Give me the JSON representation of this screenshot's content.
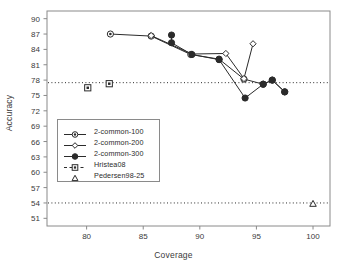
{
  "chart_data": {
    "type": "line",
    "title": "",
    "xlabel": "Coverage",
    "ylabel": "Accuracy",
    "xlim": [
      76.5,
      101.5
    ],
    "ylim": [
      49.5,
      91.5
    ],
    "xticks": [
      80,
      85,
      90,
      95,
      100
    ],
    "yticks": [
      51,
      54,
      57,
      60,
      63,
      66,
      69,
      72,
      75,
      78,
      81,
      84,
      87,
      90
    ],
    "grid": false,
    "legend_position": "center-left",
    "reference_lines": [
      {
        "name": "hristea08-reference",
        "y": 77.5,
        "style": "dotted"
      },
      {
        "name": "pedersen98-reference",
        "y": 54.0,
        "style": "dotted"
      }
    ],
    "series": [
      {
        "name": "2-common-100",
        "marker": "circle-dot",
        "points": [
          {
            "x": 82.1,
            "y": 87.0
          },
          {
            "x": 85.7,
            "y": 86.6
          },
          {
            "x": 89.2,
            "y": 83.0
          },
          {
            "x": 91.7,
            "y": 82.1
          },
          {
            "x": 93.9,
            "y": 78.2
          },
          {
            "x": 95.6,
            "y": 77.2
          },
          {
            "x": 96.4,
            "y": 78.0
          },
          {
            "x": 97.5,
            "y": 75.7
          }
        ]
      },
      {
        "name": "2-common-200",
        "marker": "open-diamond",
        "points": [
          {
            "x": 85.7,
            "y": 86.7
          },
          {
            "x": 89.3,
            "y": 83.1
          },
          {
            "x": 92.3,
            "y": 83.2
          },
          {
            "x": 93.9,
            "y": 78.3
          },
          {
            "x": 94.7,
            "y": 85.1
          }
        ]
      },
      {
        "name": "2-common-300",
        "marker": "filled-circle",
        "points": [
          {
            "x": 87.5,
            "y": 86.8
          },
          {
            "x": 87.5,
            "y": 85.3
          },
          {
            "x": 89.3,
            "y": 83.0
          },
          {
            "x": 91.7,
            "y": 82.0
          },
          {
            "x": 94.0,
            "y": 74.5
          },
          {
            "x": 95.6,
            "y": 77.2
          },
          {
            "x": 96.4,
            "y": 78.0
          },
          {
            "x": 97.5,
            "y": 75.7
          }
        ]
      },
      {
        "name": "Hristea08",
        "marker": "square",
        "points": [
          {
            "x": 80.1,
            "y": 76.5
          },
          {
            "x": 82.0,
            "y": 77.3
          }
        ]
      },
      {
        "name": "Pedersen98-25",
        "marker": "triangle",
        "points": [
          {
            "x": 100.0,
            "y": 53.8
          }
        ]
      }
    ]
  },
  "legend": {
    "items": [
      {
        "label": "2-common-100",
        "key": "circle-dot-key"
      },
      {
        "label": "2-common-200",
        "key": "open-diamond-key"
      },
      {
        "label": "2-common-300",
        "key": "filled-circle-key"
      },
      {
        "label": "Hristea08",
        "key": "square-key"
      },
      {
        "label": "Pedersen98-25",
        "key": "triangle-key"
      }
    ]
  },
  "axes": {
    "x_title": "Coverage",
    "y_title": "Accuracy",
    "x_tick_labels": [
      "80",
      "85",
      "90",
      "95",
      "100"
    ],
    "y_tick_labels": [
      "51",
      "54",
      "57",
      "60",
      "63",
      "66",
      "69",
      "72",
      "75",
      "78",
      "81",
      "84",
      "87",
      "90"
    ]
  },
  "colors": {
    "frame": "#8a8a8a",
    "line": "#2b2b2b",
    "text": "#3a3a3a",
    "background": "#ffffff"
  }
}
